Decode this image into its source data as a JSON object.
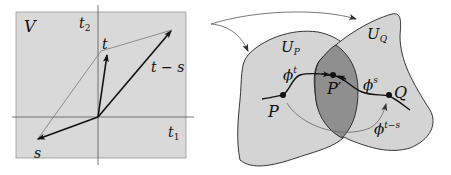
{
  "left_panel": {
    "space_label": "V",
    "axis_x_label": "t",
    "axis_x_sub": "1",
    "axis_y_label": "t",
    "axis_y_sub": "2",
    "vector_t_label": "t",
    "vector_diff_label": "t − s",
    "vector_s_label": "s"
  },
  "right_panel": {
    "region_p_label": "U",
    "region_p_sub": "P",
    "region_q_label": "U",
    "region_q_sub": "Q",
    "point_p_label": "P",
    "point_pprime_label": "P′",
    "point_q_label": "Q",
    "flow_t_label": "ϕ",
    "flow_t_sup": "t",
    "flow_s_label": "ϕ",
    "flow_s_sup": "s",
    "flow_ts_label": "ϕ",
    "flow_ts_sup": "t−s"
  },
  "colors": {
    "panel_fill": "#d9d9d9",
    "region_fill": "#d4d4d4",
    "overlap_fill": "#8f8f8f",
    "stroke": "#222222",
    "thin_stroke": "#777777"
  }
}
